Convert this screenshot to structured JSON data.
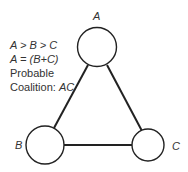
{
  "diagram": {
    "nodes": [
      {
        "id": "A",
        "label": "A",
        "cx": 97,
        "cy": 47,
        "r": 19.5
      },
      {
        "id": "B",
        "label": "B",
        "cx": 45,
        "cy": 145,
        "r": 19
      },
      {
        "id": "C",
        "label": "C",
        "cx": 148,
        "cy": 145,
        "r": 16
      }
    ],
    "edges": [
      {
        "from": "A",
        "to": "B"
      },
      {
        "from": "A",
        "to": "C"
      },
      {
        "from": "B",
        "to": "C"
      }
    ],
    "annotation": {
      "line1": "A > B > C",
      "line2": "A = (B+C)",
      "line3": "Probable",
      "line4_prefix": "Coalition: ",
      "line4_value": "AC"
    }
  }
}
